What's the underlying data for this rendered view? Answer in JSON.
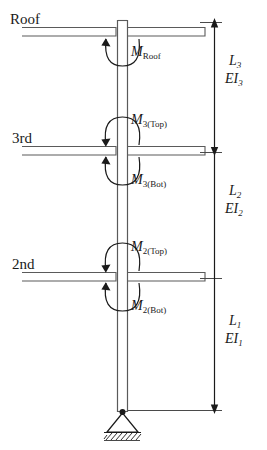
{
  "figure": {
    "colors": {
      "line": "#4a4a4a",
      "line_dark": "#1a1a1a",
      "text": "#1a1a1a",
      "background": "#ffffff"
    }
  },
  "floors": [
    {
      "key": "roof",
      "label": "Roof",
      "x": 10,
      "y": 18
    },
    {
      "key": "third",
      "label": "3rd",
      "x": 12,
      "y": 138
    },
    {
      "key": "second",
      "label": "2nd",
      "x": 12,
      "y": 264
    }
  ],
  "moments": [
    {
      "key": "m_roof",
      "base": "M",
      "sub": "Roof",
      "x": 128,
      "y": 47
    },
    {
      "key": "m3_top",
      "base": "M",
      "sub": "3(Top)",
      "x": 128,
      "y": 122
    },
    {
      "key": "m3_bot",
      "base": "M",
      "sub": "3(Bot)",
      "x": 128,
      "y": 174
    },
    {
      "key": "m2_top",
      "base": "M",
      "sub": "2(Top)",
      "x": 128,
      "y": 249
    },
    {
      "key": "m2_bot",
      "base": "M",
      "sub": "2(Bot)",
      "x": 128,
      "y": 301
    }
  ],
  "dimensions": [
    {
      "key": "seg3",
      "length_base": "L",
      "length_sub": "3",
      "stiffness_base": "EI",
      "stiffness_sub": "3",
      "x": 228,
      "y_length": 62,
      "y_stiffness": 80
    },
    {
      "key": "seg2",
      "length_base": "L",
      "length_sub": "2",
      "stiffness_base": "EI",
      "stiffness_sub": "2",
      "x": 228,
      "y_length": 192,
      "y_stiffness": 210
    },
    {
      "key": "seg1",
      "length_base": "L",
      "length_sub": "1",
      "stiffness_base": "EI",
      "stiffness_sub": "1",
      "x": 228,
      "y_length": 322,
      "y_stiffness": 340
    }
  ],
  "support": {
    "type": "pinned-support",
    "label": "",
    "x": 122,
    "y": 410
  },
  "geometry": {
    "column_left": 117,
    "column_right": 127,
    "column_top": 20,
    "column_bottom": 412,
    "beam_levels": [
      31,
      150,
      276
    ],
    "dim_line_x": 214,
    "dim_ticks": [
      22,
      152,
      278,
      410
    ]
  }
}
